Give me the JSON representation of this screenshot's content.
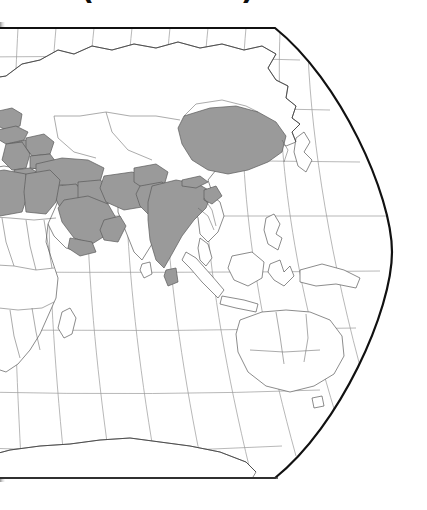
{
  "figure": {
    "caption": "(see text)",
    "caption_note": "bold parenthetical caption, clipped off at the top edge of the scan"
  },
  "map": {
    "name": "world-map",
    "projection": "robinson",
    "visible_hemisphere": "eastern",
    "frame": {
      "border_color": "#111111",
      "border_width_px": 2.2,
      "top_edge_y": 8,
      "bottom_edge_y": 458,
      "right_edge_shape": "curved"
    },
    "graticule": {
      "color": "#9a9a9a",
      "width_px": 0.7,
      "parallel_spacing_deg": 20,
      "meridian_spacing_deg": 20,
      "parallels": [
        60,
        40,
        20,
        0,
        -20,
        -40,
        -60
      ],
      "meridians": [
        20,
        40,
        60,
        80,
        100,
        120,
        140,
        160,
        180
      ]
    },
    "colors": {
      "land_fill": "#ffffff",
      "highlight_fill": "#9b9b9b",
      "coastline": "#4a4a4a",
      "country_border": "#5a5a5a",
      "ocean": "#ffffff"
    },
    "legend_visible": false,
    "labels_visible": false,
    "highlighted_regions": [
      "Poland",
      "Czechia",
      "Slovakia",
      "Hungary",
      "Romania",
      "Bulgaria",
      "Serbia",
      "Bosnia and Herzegovina",
      "Croatia",
      "Albania",
      "Greece",
      "Turkey",
      "Syria",
      "Lebanon",
      "Israel",
      "Jordan",
      "Iraq",
      "Iran",
      "Saudi Arabia",
      "Yemen",
      "Oman",
      "United Arab Emirates",
      "Kuwait",
      "Afghanistan",
      "Pakistan",
      "India",
      "Bangladesh",
      "Sri Lanka",
      "Nepal",
      "China",
      "Libya",
      "Egypt"
    ],
    "unhighlighted_notable": [
      "Russia",
      "Mongolia",
      "Kazakhstan",
      "Japan",
      "Korea",
      "Southeast Asia",
      "Indonesia",
      "Australia",
      "Papua New Guinea",
      "Sub-Saharan Africa",
      "Antarctica"
    ]
  }
}
